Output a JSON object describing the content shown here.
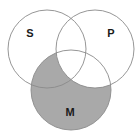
{
  "diagram": {
    "type": "venn",
    "sets": [
      {
        "id": "S",
        "label": "S",
        "cx": 47,
        "cy": 49,
        "r": 39,
        "label_x": 30,
        "label_y": 33
      },
      {
        "id": "P",
        "label": "P",
        "cx": 95,
        "cy": 49,
        "r": 39,
        "label_x": 111,
        "label_y": 33
      },
      {
        "id": "M",
        "label": "M",
        "cx": 71,
        "cy": 90,
        "r": 40,
        "label_x": 70,
        "label_y": 112
      }
    ],
    "shaded_region": "M minus P",
    "colors": {
      "shade": "#a9a9a9",
      "stroke": "#8a8a8a",
      "background": "#ffffff",
      "label": "#1a1a1a"
    }
  }
}
